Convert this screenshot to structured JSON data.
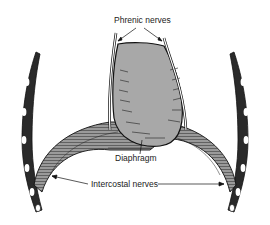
{
  "figure": {
    "colors": {
      "background": "#ffffff",
      "ink": "#1a1a1a",
      "heart_fill": "#a8a8a8",
      "muscle_fill": "#8a8a8a",
      "bone_fill": "#ffffff"
    }
  },
  "labels": {
    "phrenic": "Phrenic nerves",
    "diaphragm": "Diaphragm",
    "intercostal": "Intercostal nerves"
  }
}
